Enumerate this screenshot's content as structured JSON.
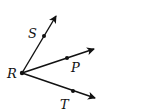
{
  "diagram": {
    "vertex": {
      "label": "R",
      "x": 22,
      "y": 73
    },
    "rays": [
      {
        "name": "ray-RS",
        "label": "S",
        "point": {
          "x": 44,
          "y": 36
        },
        "tip": {
          "x": 56,
          "y": 16
        },
        "label_pos": {
          "x": 28,
          "y": 38
        }
      },
      {
        "name": "ray-RP",
        "label": "P",
        "point": {
          "x": 67,
          "y": 58
        },
        "tip": {
          "x": 94,
          "y": 49
        },
        "label_pos": {
          "x": 71,
          "y": 72
        }
      },
      {
        "name": "ray-RT",
        "label": "T",
        "point": {
          "x": 73,
          "y": 91
        },
        "tip": {
          "x": 95,
          "y": 98
        },
        "label_pos": {
          "x": 60,
          "y": 109
        }
      }
    ],
    "color": "#111111"
  }
}
